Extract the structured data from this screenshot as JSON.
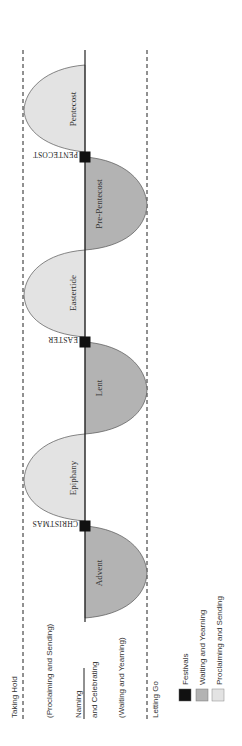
{
  "diagram": {
    "rows": {
      "top": "Taking Hold",
      "top_sub": "(Proclaiming and Sending)",
      "middle_line1": "Naming",
      "middle_line2": "and Celebrating",
      "bottom_sub": "(Waiting and Yearning)",
      "bottom": "Letting Go"
    },
    "seasons": [
      {
        "name": "Advent",
        "type": "waiting"
      },
      {
        "name": "Epiphany",
        "type": "proclaiming"
      },
      {
        "name": "Lent",
        "type": "waiting"
      },
      {
        "name": "Eastertide",
        "type": "proclaiming"
      },
      {
        "name": "Pre-Pentecost",
        "type": "waiting"
      },
      {
        "name": "Pentecost",
        "type": "proclaiming"
      }
    ],
    "festivals": [
      "CHRISTMAS",
      "EASTER",
      "PENTECOST"
    ],
    "legend": [
      {
        "label": "Festivals",
        "color": "#111111"
      },
      {
        "label": "Waiting and Yearning",
        "color": "#b3b3b3"
      },
      {
        "label": "Proclaiming and Sending",
        "color": "#e3e3e3"
      }
    ],
    "colors": {
      "festival": "#111111",
      "waiting": "#b3b3b3",
      "proclaiming": "#e3e3e3",
      "line": "#333333"
    }
  }
}
